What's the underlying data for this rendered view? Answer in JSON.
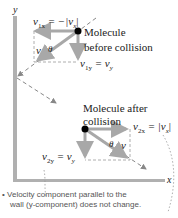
{
  "axes": {
    "y_label": "y",
    "x_label": "x"
  },
  "before": {
    "title_line1": "Molecule",
    "title_line2": "before collision",
    "v1x": "v",
    "v1x_sub": "1x",
    "v1x_rhs": " = −|v",
    "v1x_rhs_sub": "x",
    "v1x_close": "|",
    "v1y": "v",
    "v1y_sub": "1y",
    "v1y_rhs": " = v",
    "v1y_rhs_sub": "y",
    "v_label": "v",
    "theta_label": "θ"
  },
  "after": {
    "title_line1": "Molecule after",
    "title_line2": "collision",
    "v2x": "v",
    "v2x_sub": "2x",
    "v2x_rhs": " = |v",
    "v2x_rhs_sub": "x",
    "v2x_close": "|",
    "v2y": "v",
    "v2y_sub": "2y",
    "v2y_rhs": " = v",
    "v2y_rhs_sub": "y",
    "v_label": "v",
    "theta_label": "θ"
  },
  "caption": {
    "bullet": "•",
    "line1": "Velocity component parallel to the",
    "line2": "wall (y-component) does not change."
  },
  "colors": {
    "axis": "#8a8a8a",
    "arrow": "#a8a8a8",
    "dashed": "#888888",
    "dot": "#000000"
  }
}
